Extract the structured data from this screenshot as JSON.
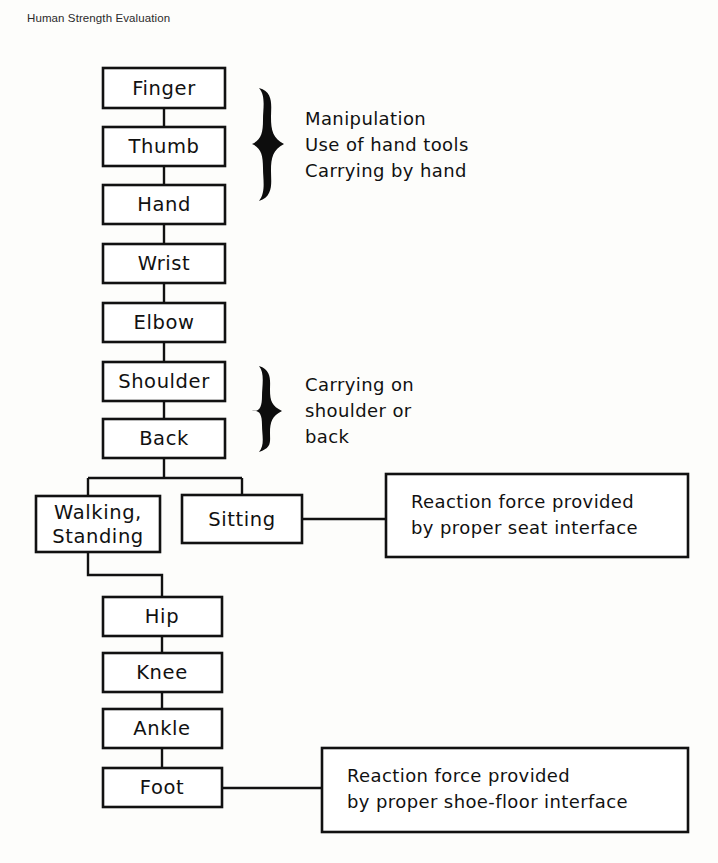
{
  "caption": "Human Strength Evaluation",
  "diagram": {
    "type": "flowchart",
    "title": "Human Strength Evaluation",
    "chain_nodes": [
      {
        "id": "finger",
        "label": "Finger",
        "x": 103,
        "y": 68,
        "w": 122,
        "h": 40
      },
      {
        "id": "thumb",
        "label": "Thumb",
        "x": 103,
        "y": 127,
        "w": 122,
        "h": 39
      },
      {
        "id": "hand",
        "label": "Hand",
        "x": 103,
        "y": 185,
        "w": 122,
        "h": 39
      },
      {
        "id": "wrist",
        "label": "Wrist",
        "x": 103,
        "y": 244,
        "w": 122,
        "h": 39
      },
      {
        "id": "elbow",
        "label": "Elbow",
        "x": 103,
        "y": 303,
        "w": 122,
        "h": 39
      },
      {
        "id": "shoulder",
        "label": "Shoulder",
        "x": 103,
        "y": 362,
        "w": 122,
        "h": 39
      },
      {
        "id": "back",
        "label": "Back",
        "x": 103,
        "y": 419,
        "w": 122,
        "h": 39
      },
      {
        "id": "hip",
        "label": "Hip",
        "x": 103,
        "y": 597,
        "w": 119,
        "h": 39
      },
      {
        "id": "knee",
        "label": "Knee",
        "x": 103,
        "y": 653,
        "w": 119,
        "h": 39
      },
      {
        "id": "ankle",
        "label": "Ankle",
        "x": 103,
        "y": 709,
        "w": 119,
        "h": 39
      },
      {
        "id": "foot",
        "label": "Foot",
        "x": 103,
        "y": 768,
        "w": 119,
        "h": 39
      }
    ],
    "branch_nodes": [
      {
        "id": "walking",
        "label_line1": "Walking,",
        "label_line2": "Standing",
        "x": 36,
        "y": 496,
        "w": 124,
        "h": 56
      },
      {
        "id": "sitting",
        "label": "Sitting",
        "x": 182,
        "y": 495,
        "w": 120,
        "h": 48
      }
    ],
    "callouts": [
      {
        "id": "seat-callout",
        "line1": "Reaction  force  provided",
        "line2": "by  proper  seat  interface",
        "x": 386,
        "y": 474,
        "w": 302,
        "h": 83,
        "source": "sitting"
      },
      {
        "id": "floor-callout",
        "line1": "Reaction  force  provided",
        "line2": "by  proper  shoe-floor  interface",
        "x": 322,
        "y": 748,
        "w": 366,
        "h": 84,
        "source": "foot"
      }
    ],
    "brace_groups": [
      {
        "id": "upper-brace",
        "lines": [
          "Manipulation",
          "Use of hand tools",
          "Carrying by hand"
        ],
        "brace_x": 258,
        "brace_top": 88,
        "brace_bottom": 202,
        "text_x": 305,
        "text_top": 118
      },
      {
        "id": "lower-brace",
        "lines": [
          "Carrying  on",
          "shoulder  or",
          "back"
        ],
        "brace_x": 258,
        "brace_top": 366,
        "brace_bottom": 452,
        "text_x": 305,
        "text_top": 384
      }
    ],
    "colors": {
      "line": "#111111",
      "box_fill": "#ffffff",
      "background": "#fdfdfb",
      "text": "#111111"
    }
  }
}
